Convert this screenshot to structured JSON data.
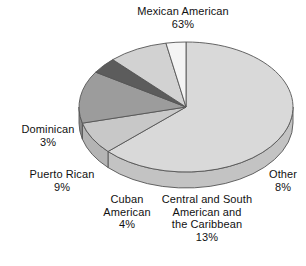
{
  "figure": {
    "type": "pie-chart-3d",
    "background": "#ffffff",
    "text_color": "#111111"
  },
  "chart_data": {
    "type": "pie",
    "title": "",
    "subtitle": "",
    "xlabel": "",
    "ylabel": "",
    "grid": false,
    "legend_position": "none",
    "labels_position": "outside",
    "three_d": true,
    "start_angle_deg": 0,
    "direction": "clockwise",
    "categories": [
      "Mexican American",
      "Other",
      "Central and South American and the Caribbean",
      "Cuban American",
      "Puerto Rican",
      "Dominican"
    ],
    "values": [
      63,
      8,
      13,
      4,
      9,
      3
    ],
    "units": "percent",
    "total": 100,
    "slices": [
      {
        "name": "Mexican American",
        "value": 63,
        "value_text": "63%",
        "label_line1": "Mexican American",
        "label_line2": "63%",
        "color": "#d9d9d9",
        "side_color": "#c3c3c3",
        "start_deg": 0,
        "end_deg": 226.8
      },
      {
        "name": "Other",
        "value": 8,
        "value_text": "8%",
        "label_line1": "Other",
        "label_line2": "8%",
        "color": "#c8c8c8",
        "side_color": "#b4b4b4",
        "start_deg": 226.8,
        "end_deg": 255.6
      },
      {
        "name": "Central and South American and the Caribbean",
        "value": 13,
        "value_text": "13%",
        "label_line1": "Central and South",
        "label_line2": "American and",
        "label_line3": "the Caribbean",
        "label_line4": "13%",
        "color": "#9c9c9c",
        "side_color": "#8a8a8a",
        "start_deg": 255.6,
        "end_deg": 302.4
      },
      {
        "name": "Cuban American",
        "value": 4,
        "value_text": "4%",
        "label_line1": "Cuban",
        "label_line2": "American",
        "label_line3": "4%",
        "color": "#5c5c5c",
        "side_color": "#4a4a4a",
        "start_deg": 302.4,
        "end_deg": 316.8
      },
      {
        "name": "Puerto Rican",
        "value": 9,
        "value_text": "9%",
        "label_line1": "Puerto Rican",
        "label_line2": "9%",
        "color": "#d2d2d2",
        "side_color": "#bdbdbd",
        "start_deg": 316.8,
        "end_deg": 349.2
      },
      {
        "name": "Dominican",
        "value": 3,
        "value_text": "3%",
        "label_line1": "Dominican",
        "label_line2": "3%",
        "color": "#f4f4f4",
        "side_color": "#dedede",
        "start_deg": 349.2,
        "end_deg": 360
      }
    ]
  },
  "labels": {
    "mexican_american": "Mexican American\n63%",
    "dominican": "Dominican\n3%",
    "puerto_rican": "Puerto Rican\n9%",
    "cuban_american": "Cuban\nAmerican\n4%",
    "central_south": "Central and South\nAmerican and\nthe Caribbean\n13%",
    "other": "Other\n8%"
  }
}
